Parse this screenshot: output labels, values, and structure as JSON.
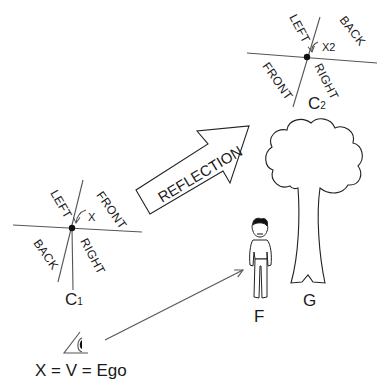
{
  "diagram": {
    "frame_c1": {
      "name": "C",
      "subscript": "1",
      "labels": {
        "left": "LEFT",
        "front": "FRONT",
        "back": "BACK",
        "right": "RIGHT",
        "x": "X"
      }
    },
    "frame_c2": {
      "name": "C",
      "subscript": "2",
      "labels": {
        "left": "LEFT",
        "back": "BACK",
        "front": "FRONT",
        "right": "RIGHT",
        "x": "X2"
      }
    },
    "reflection_arrow": {
      "label": "REFLECTION"
    },
    "figure_label": "F",
    "tree_label": "G",
    "ego_caption": "X = V = Ego",
    "icons": [
      "eye-icon",
      "person-icon",
      "tree-icon",
      "big-arrow-icon"
    ]
  }
}
